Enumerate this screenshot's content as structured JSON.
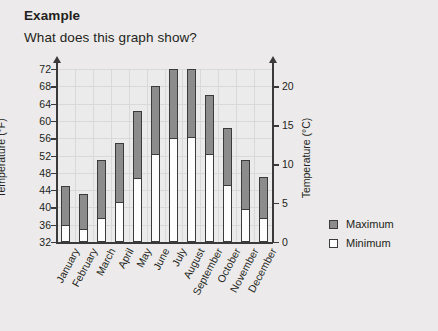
{
  "header": {
    "title": "Example",
    "question": "What does this graph show?"
  },
  "legend": {
    "items": [
      {
        "label": "Maximum",
        "swatch": "filled-gray-square",
        "color": "#8c8c8c"
      },
      {
        "label": "Minimum",
        "swatch": "white-square",
        "color": "#ffffff"
      }
    ]
  },
  "chart_data": {
    "type": "bar",
    "title": "",
    "xlabel": "",
    "ylabel": "Temperature (°F)",
    "ylabel_secondary": "Temperature (°C)",
    "ylim": [
      32,
      72
    ],
    "ylim_secondary": [
      0,
      22.2
    ],
    "yticks": [
      32,
      36,
      40,
      44,
      48,
      52,
      56,
      60,
      64,
      68,
      72
    ],
    "yticks_secondary": [
      0,
      5,
      10,
      15,
      20
    ],
    "grid": true,
    "legend_position": "right",
    "categories": [
      "January",
      "February",
      "March",
      "April",
      "May",
      "June",
      "July",
      "August",
      "September",
      "October",
      "November",
      "December"
    ],
    "series": [
      {
        "name": "Maximum",
        "color": "#8c8c8c",
        "values": [
          45,
          43,
          51,
          55,
          62.3,
          68,
          72,
          72,
          66,
          58.3,
          51,
          47
        ]
      },
      {
        "name": "Minimum",
        "color": "#ffffff",
        "values": [
          35.8,
          34.7,
          37.3,
          41,
          46.5,
          52,
          55.8,
          56,
          52,
          45,
          39.5,
          37.4
        ]
      }
    ]
  }
}
